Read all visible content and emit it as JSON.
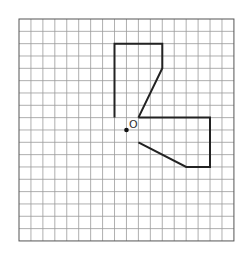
{
  "grid": {
    "cols": 18,
    "rows": 18,
    "origin_px": [
      19,
      19
    ],
    "cell_w": 11.94,
    "cell_h": 12.33,
    "line_color": "#9a9a9a",
    "border_color": "#555555"
  },
  "shapes": {
    "upper_polyline": {
      "points": [
        [
          8,
          8
        ],
        [
          8,
          2
        ],
        [
          12,
          2
        ],
        [
          12,
          4
        ],
        [
          10,
          8
        ]
      ],
      "stroke": "#222222"
    },
    "lower_polyline": {
      "points": [
        [
          10,
          8
        ],
        [
          16,
          8
        ],
        [
          16,
          12
        ],
        [
          14,
          12
        ],
        [
          10,
          10
        ]
      ],
      "stroke": "#222222"
    }
  },
  "center_point": {
    "grid_pos": [
      9,
      9
    ],
    "label": "O",
    "color": "#111111"
  }
}
